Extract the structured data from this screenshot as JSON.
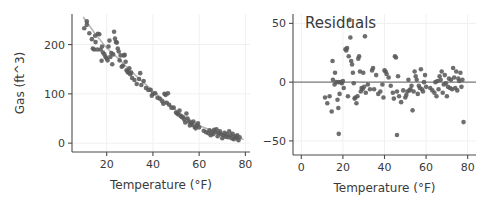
{
  "figure": {
    "background_color": "#ffffff",
    "point_color": "#5a5a5a",
    "fit_line_color": "#b6b6b6",
    "zero_line_color": "#7a7a7a",
    "grid_color": "#f0f0f0",
    "axis_color": "#4d4d4d"
  },
  "chart_data": [
    {
      "type": "scatter",
      "id": "gas-vs-temperature",
      "title": "",
      "xlabel": "Temperature (°F)",
      "ylabel": "Gas (ft^3)",
      "xlim": [
        5,
        82
      ],
      "ylim": [
        -18,
        262
      ],
      "xticks": [
        20,
        40,
        60,
        80
      ],
      "xticklabels": [
        "20",
        "40",
        "60",
        "80"
      ],
      "yticks": [
        0,
        100,
        200
      ],
      "yticklabels": [
        "0",
        "100",
        "200"
      ],
      "grid": true,
      "legend": "none",
      "annotations": [],
      "series": [
        {
          "name": "Gas usage",
          "marker": "circle",
          "color": "#5a5a5a",
          "x": [
            10.3,
            11.4,
            11.4,
            12.5,
            13.6,
            14.0,
            14.6,
            15.0,
            15.2,
            16.0,
            16.2,
            16.8,
            17.4,
            17.8,
            18.0,
            18.4,
            19.0,
            19.5,
            20.0,
            20.4,
            20.8,
            21.2,
            21.6,
            22.0,
            22.4,
            22.8,
            23.2,
            23.6,
            24.0,
            24.4,
            24.8,
            25.2,
            25.6,
            26.0,
            26.5,
            27.0,
            27.4,
            27.8,
            28.2,
            28.6,
            29.0,
            29.4,
            29.8,
            30.2,
            30.6,
            31.0,
            32.0,
            33.0,
            34.0,
            34.5,
            35.0,
            36.0,
            37.0,
            38.0,
            39.0,
            39.5,
            40.0,
            41.0,
            42.0,
            43.0,
            44.0,
            44.5,
            45.0,
            45.5,
            46.0,
            46.5,
            47.0,
            48.0,
            49.0,
            50.0,
            50.5,
            51.0,
            51.5,
            52.0,
            52.5,
            53.0,
            53.5,
            54.0,
            54.5,
            55.0,
            55.5,
            56.0,
            56.5,
            57.0,
            57.5,
            58.0,
            58.5,
            59.0,
            59.5,
            60.0,
            62.0,
            63.0,
            64.0,
            64.5,
            65.0,
            65.5,
            66.0,
            66.5,
            67.0,
            67.5,
            68.0,
            68.5,
            69.0,
            69.5,
            70.0,
            70.5,
            71.0,
            71.5,
            72.0,
            72.5,
            73.0,
            73.5,
            74.0,
            74.5,
            75.0,
            75.5,
            76.0,
            76.5,
            77.0,
            77.5
          ],
          "y": [
            233,
            247,
            240,
            223,
            211,
            192,
            190,
            218,
            205,
            190,
            222,
            221,
            190,
            167,
            196,
            184,
            180,
            175,
            172,
            168,
            196,
            208,
            175,
            183,
            160,
            180,
            226,
            212,
            205,
            204,
            192,
            186,
            168,
            178,
            155,
            157,
            178,
            179,
            165,
            148,
            145,
            143,
            152,
            140,
            143,
            132,
            128,
            120,
            130,
            142,
            118,
            126,
            112,
            108,
            108,
            96,
            100,
            101,
            92,
            90,
            85,
            80,
            100,
            98,
            82,
            101,
            78,
            72,
            72,
            62,
            60,
            58,
            66,
            55,
            53,
            52,
            48,
            42,
            60,
            50,
            44,
            36,
            41,
            38,
            44,
            33,
            30,
            36,
            40,
            32,
            25,
            22,
            20,
            26,
            16,
            23,
            18,
            27,
            22,
            28,
            14,
            20,
            24,
            18,
            10,
            16,
            21,
            13,
            18,
            12,
            24,
            16,
            10,
            19,
            8,
            14,
            11,
            16,
            6,
            12
          ]
        }
      ],
      "fit_line": {
        "name": "Smoothed fit",
        "color": "#b6b6b6",
        "x": [
          10.0,
          15.0,
          20.0,
          25.0,
          30.0,
          35.0,
          40.0,
          45.0,
          50.0,
          55.0,
          60.0,
          65.0,
          70.0,
          75.0,
          79.0
        ],
        "y": [
          255,
          222,
          193,
          172,
          148,
          127,
          106,
          86,
          67,
          50,
          36,
          26,
          18,
          12,
          8
        ]
      }
    },
    {
      "type": "scatter",
      "id": "residuals-vs-temperature",
      "title": "Residuals",
      "xlabel": "Temperature (°F)",
      "ylabel": "",
      "xlim": [
        -4,
        84
      ],
      "ylim": [
        -62,
        58
      ],
      "xticks": [
        0,
        20,
        40,
        60,
        80
      ],
      "xticklabels": [
        "0",
        "20",
        "40",
        "60",
        "80"
      ],
      "yticks": [
        -50,
        0,
        50
      ],
      "yticklabels": [
        "−50",
        "0",
        "50"
      ],
      "grid": true,
      "legend": "none",
      "reference_line": {
        "y": 0,
        "color": "#7a7a7a"
      },
      "series": [
        {
          "name": "Residuals",
          "marker": "circle",
          "color": "#5a5a5a",
          "x": [
            11.4,
            12.5,
            13.6,
            14.6,
            15.0,
            15.2,
            16.0,
            16.2,
            16.8,
            17.4,
            17.8,
            18.0,
            18.4,
            19.0,
            19.5,
            20.0,
            20.4,
            21.2,
            21.6,
            22.0,
            22.4,
            22.8,
            23.2,
            23.6,
            24.0,
            24.4,
            24.8,
            25.2,
            25.6,
            26.0,
            26.5,
            27.0,
            27.4,
            27.8,
            28.2,
            28.6,
            29.0,
            29.4,
            29.8,
            30.2,
            30.6,
            31.0,
            32.0,
            33.0,
            34.0,
            34.5,
            35.0,
            36.0,
            37.0,
            38.0,
            39.0,
            39.5,
            40.0,
            40.5,
            41.0,
            42.0,
            43.0,
            44.0,
            44.5,
            45.0,
            45.5,
            46.0,
            46.5,
            47.0,
            48.0,
            49.0,
            50.0,
            50.5,
            51.0,
            51.5,
            52.0,
            52.5,
            53.0,
            53.5,
            54.0,
            54.5,
            55.0,
            55.5,
            56.0,
            56.5,
            57.0,
            57.5,
            58.0,
            58.5,
            59.0,
            59.5,
            60.0,
            62.0,
            63.0,
            64.0,
            64.5,
            65.0,
            65.5,
            66.0,
            66.5,
            67.0,
            67.5,
            68.0,
            68.5,
            69.0,
            69.5,
            70.0,
            70.5,
            71.0,
            71.5,
            72.0,
            72.5,
            73.0,
            73.5,
            74.0,
            74.5,
            75.0,
            75.5,
            76.0,
            76.5,
            77.0,
            77.5,
            78.0,
            46.0,
            18.0
          ],
          "y": [
            -13,
            -18,
            -12,
            -25,
            18,
            2,
            -2,
            8,
            0,
            -15,
            -22,
            0,
            -10,
            0,
            -1,
            1,
            -5,
            28,
            27,
            29,
            -12,
            22,
            53,
            38,
            18,
            15,
            8,
            -1,
            -14,
            -13,
            -18,
            -12,
            20,
            22,
            9,
            -8,
            -5,
            -6,
            8,
            -4,
            39,
            -9,
            -2,
            -6,
            10,
            12,
            -6,
            6,
            -10,
            -8,
            -2,
            -13,
            10,
            9,
            7,
            4,
            -3,
            -9,
            -14,
            22,
            21,
            -8,
            5,
            -12,
            -17,
            -7,
            -13,
            -11,
            -8,
            2,
            -7,
            -6,
            -3,
            -24,
            -8,
            9,
            5,
            2,
            -10,
            -3,
            -5,
            11,
            -6,
            -8,
            0,
            6,
            -4,
            -5,
            -7,
            -9,
            0,
            -12,
            1,
            -6,
            5,
            2,
            9,
            -9,
            -2,
            6,
            -1,
            -12,
            -4,
            3,
            -5,
            2,
            -6,
            12,
            4,
            -5,
            9,
            -7,
            3,
            1,
            8,
            -4,
            2,
            -34,
            -45,
            -44
          ]
        }
      ]
    }
  ]
}
